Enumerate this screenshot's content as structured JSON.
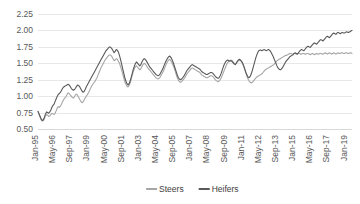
{
  "chart_data": {
    "type": "line",
    "title": "",
    "xlabel": "",
    "ylabel": "",
    "ylim": [
      0.5,
      2.25
    ],
    "ytick_labels": [
      "2.25",
      "2.00",
      "1.75",
      "1.50",
      "1.25",
      "1.00",
      "0.75",
      "0.50"
    ],
    "ytick_values": [
      2.25,
      2.0,
      1.75,
      1.5,
      1.25,
      1.0,
      0.75,
      0.5
    ],
    "grid": true,
    "legend_position": "bottom",
    "x_start": "Jan-95",
    "x_tick_interval_months": 16,
    "xtick_labels": [
      "Jan-95",
      "May-96",
      "Sep-97",
      "Jan-99",
      "May-00",
      "Sep-01",
      "Jan-03",
      "May-04",
      "Sep-05",
      "Jan-07",
      "May-08",
      "Sep-09",
      "Jan-11",
      "May-12",
      "Sep-13",
      "Jan-15",
      "May-16",
      "Sep-17",
      "Jan-19"
    ],
    "colors": {
      "steers": "#A6A6A6",
      "heifers": "#595959",
      "gridline": "#E8E8E8",
      "text": "#595959"
    },
    "series": [
      {
        "name": "Steers",
        "color": "#A6A6A6",
        "values": [
          0.76,
          0.72,
          0.68,
          0.64,
          0.62,
          0.63,
          0.66,
          0.7,
          0.72,
          0.71,
          0.69,
          0.7,
          0.72,
          0.74,
          0.73,
          0.72,
          0.74,
          0.78,
          0.82,
          0.84,
          0.83,
          0.85,
          0.88,
          0.92,
          0.95,
          0.97,
          0.99,
          1.02,
          1.05,
          1.04,
          1.02,
          1.0,
          0.98,
          0.97,
          0.99,
          1.02,
          1.03,
          1.01,
          0.98,
          0.95,
          0.92,
          0.9,
          0.91,
          0.94,
          0.97,
          1.0,
          1.02,
          1.05,
          1.08,
          1.12,
          1.15,
          1.18,
          1.2,
          1.22,
          1.25,
          1.28,
          1.32,
          1.36,
          1.4,
          1.44,
          1.47,
          1.5,
          1.53,
          1.56,
          1.58,
          1.6,
          1.62,
          1.63,
          1.62,
          1.6,
          1.57,
          1.54,
          1.55,
          1.57,
          1.56,
          1.53,
          1.5,
          1.45,
          1.4,
          1.34,
          1.28,
          1.22,
          1.18,
          1.15,
          1.14,
          1.16,
          1.2,
          1.26,
          1.32,
          1.38,
          1.42,
          1.45,
          1.46,
          1.44,
          1.42,
          1.4,
          1.42,
          1.45,
          1.48,
          1.5,
          1.49,
          1.47,
          1.44,
          1.42,
          1.4,
          1.38,
          1.36,
          1.34,
          1.32,
          1.3,
          1.28,
          1.27,
          1.26,
          1.27,
          1.29,
          1.32,
          1.35,
          1.38,
          1.42,
          1.46,
          1.5,
          1.53,
          1.55,
          1.56,
          1.54,
          1.51,
          1.47,
          1.43,
          1.38,
          1.33,
          1.28,
          1.24,
          1.22,
          1.21,
          1.22,
          1.24,
          1.26,
          1.28,
          1.31,
          1.34,
          1.36,
          1.38,
          1.4,
          1.42,
          1.43,
          1.42,
          1.41,
          1.4,
          1.39,
          1.38,
          1.37,
          1.36,
          1.34,
          1.32,
          1.31,
          1.3,
          1.29,
          1.28,
          1.28,
          1.29,
          1.3,
          1.31,
          1.31,
          1.3,
          1.28,
          1.26,
          1.24,
          1.23,
          1.22,
          1.23,
          1.25,
          1.28,
          1.32,
          1.36,
          1.4,
          1.44,
          1.48,
          1.51,
          1.53,
          1.54,
          1.55,
          1.54,
          1.52,
          1.5,
          1.49,
          1.5,
          1.52,
          1.54,
          1.55,
          1.54,
          1.52,
          1.49,
          1.45,
          1.4,
          1.35,
          1.3,
          1.26,
          1.23,
          1.21,
          1.2,
          1.21,
          1.23,
          1.25,
          1.27,
          1.29,
          1.3,
          1.31,
          1.32,
          1.33,
          1.34,
          1.36,
          1.38,
          1.4,
          1.41,
          1.42,
          1.43,
          1.44,
          1.45,
          1.46,
          1.47,
          1.48,
          1.5,
          1.52,
          1.54,
          1.55,
          1.56,
          1.57,
          1.58,
          1.59,
          1.6,
          1.61,
          1.62,
          1.62,
          1.63,
          1.64,
          1.65,
          1.65,
          1.64,
          1.64,
          1.65,
          1.65,
          1.64,
          1.64,
          1.65,
          1.65,
          1.64,
          1.64,
          1.65,
          1.65,
          1.64,
          1.64,
          1.65,
          1.65,
          1.64,
          1.63,
          1.64,
          1.65,
          1.64,
          1.63,
          1.64,
          1.65,
          1.64,
          1.64,
          1.65,
          1.65,
          1.64,
          1.64,
          1.65,
          1.66,
          1.65,
          1.64,
          1.65,
          1.66,
          1.65,
          1.64,
          1.65,
          1.66,
          1.65,
          1.64,
          1.65,
          1.66,
          1.65,
          1.65,
          1.66,
          1.66,
          1.65,
          1.65,
          1.66,
          1.66,
          1.65,
          1.65,
          1.66,
          1.66,
          1.65
        ]
      },
      {
        "name": "Heifers",
        "color": "#595959",
        "values": [
          0.77,
          0.73,
          0.69,
          0.65,
          0.63,
          0.64,
          0.68,
          0.73,
          0.76,
          0.75,
          0.74,
          0.76,
          0.79,
          0.83,
          0.86,
          0.88,
          0.92,
          0.96,
          1.0,
          1.03,
          1.04,
          1.06,
          1.09,
          1.12,
          1.14,
          1.15,
          1.16,
          1.17,
          1.18,
          1.17,
          1.15,
          1.12,
          1.1,
          1.09,
          1.1,
          1.12,
          1.15,
          1.17,
          1.16,
          1.14,
          1.11,
          1.08,
          1.06,
          1.07,
          1.1,
          1.14,
          1.17,
          1.2,
          1.23,
          1.26,
          1.29,
          1.32,
          1.35,
          1.38,
          1.41,
          1.44,
          1.47,
          1.5,
          1.53,
          1.56,
          1.59,
          1.62,
          1.65,
          1.68,
          1.7,
          1.72,
          1.74,
          1.75,
          1.74,
          1.72,
          1.69,
          1.66,
          1.68,
          1.71,
          1.7,
          1.67,
          1.62,
          1.56,
          1.49,
          1.42,
          1.35,
          1.28,
          1.23,
          1.19,
          1.17,
          1.19,
          1.23,
          1.29,
          1.35,
          1.41,
          1.46,
          1.5,
          1.52,
          1.5,
          1.48,
          1.46,
          1.48,
          1.52,
          1.55,
          1.57,
          1.56,
          1.54,
          1.51,
          1.48,
          1.45,
          1.43,
          1.41,
          1.39,
          1.37,
          1.35,
          1.33,
          1.32,
          1.31,
          1.32,
          1.34,
          1.37,
          1.4,
          1.44,
          1.48,
          1.52,
          1.55,
          1.58,
          1.6,
          1.61,
          1.59,
          1.56,
          1.52,
          1.47,
          1.42,
          1.37,
          1.32,
          1.28,
          1.26,
          1.25,
          1.26,
          1.28,
          1.3,
          1.33,
          1.36,
          1.39,
          1.41,
          1.43,
          1.45,
          1.47,
          1.48,
          1.47,
          1.46,
          1.45,
          1.44,
          1.43,
          1.42,
          1.41,
          1.39,
          1.37,
          1.36,
          1.35,
          1.34,
          1.33,
          1.33,
          1.34,
          1.35,
          1.36,
          1.36,
          1.35,
          1.33,
          1.31,
          1.29,
          1.28,
          1.27,
          1.28,
          1.31,
          1.35,
          1.4,
          1.45,
          1.49,
          1.52,
          1.54,
          1.55,
          1.54,
          1.53,
          1.54,
          1.53,
          1.51,
          1.49,
          1.48,
          1.5,
          1.53,
          1.55,
          1.56,
          1.55,
          1.53,
          1.5,
          1.46,
          1.41,
          1.36,
          1.32,
          1.29,
          1.28,
          1.3,
          1.34,
          1.39,
          1.45,
          1.51,
          1.57,
          1.62,
          1.66,
          1.69,
          1.7,
          1.7,
          1.69,
          1.7,
          1.71,
          1.7,
          1.69,
          1.7,
          1.71,
          1.7,
          1.68,
          1.65,
          1.62,
          1.58,
          1.54,
          1.5,
          1.46,
          1.43,
          1.41,
          1.4,
          1.41,
          1.43,
          1.46,
          1.49,
          1.52,
          1.54,
          1.56,
          1.58,
          1.6,
          1.61,
          1.62,
          1.63,
          1.65,
          1.66,
          1.65,
          1.64,
          1.66,
          1.68,
          1.7,
          1.71,
          1.7,
          1.69,
          1.71,
          1.73,
          1.75,
          1.76,
          1.75,
          1.74,
          1.76,
          1.78,
          1.8,
          1.81,
          1.8,
          1.79,
          1.81,
          1.83,
          1.85,
          1.86,
          1.85,
          1.84,
          1.86,
          1.88,
          1.9,
          1.91,
          1.9,
          1.89,
          1.91,
          1.93,
          1.95,
          1.96,
          1.95,
          1.94,
          1.96,
          1.97,
          1.96,
          1.95,
          1.96,
          1.97,
          1.96,
          1.96,
          1.97,
          1.98,
          1.97,
          1.97,
          1.98,
          1.99,
          2.0
        ]
      }
    ]
  },
  "legend": {
    "items": [
      {
        "label": "Steers",
        "color": "#A6A6A6"
      },
      {
        "label": "Heifers",
        "color": "#595959"
      }
    ]
  }
}
